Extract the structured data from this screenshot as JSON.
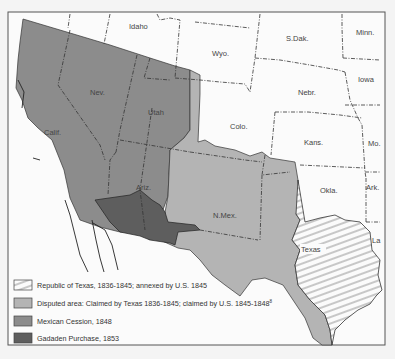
{
  "map": {
    "state_labels": {
      "idaho": "Idaho",
      "wyo": "Wyo.",
      "sdak": "S.Dak.",
      "minn": "Minn.",
      "nev": "Nev.",
      "utah": "Utah",
      "nebr": "Nebr.",
      "iowa": "Iowa",
      "calif": "Calif.",
      "colo": "Colo.",
      "kans": "Kans.",
      "mo": "Mo.",
      "ariz": "Ariz.",
      "nmex": "N.Mex.",
      "okla": "Okla.",
      "ark": "Ark.",
      "texas": "Texas",
      "la": "La"
    },
    "colors": {
      "mexican_cession": "#8c8c8c",
      "disputed_area": "#b4b4b4",
      "gadsden_purchase": "#5e5e5e",
      "republic_of_texas": "hatched",
      "background": "#fbfbfb"
    }
  },
  "legend": {
    "items": [
      {
        "key": "republic_of_texas",
        "label": "Republic of Texas, 1836-1845; annexed by  U.S. 1845"
      },
      {
        "key": "disputed_area",
        "label": "Disputed area: Claimed by Texas 1836-1845; claimed by U.S. 1845-1848",
        "superscript": "8"
      },
      {
        "key": "mexican_cession",
        "label": "Mexican Cession, 1848"
      },
      {
        "key": "gadsden_purchase",
        "label": "Gadaden Purchase, 1853"
      }
    ]
  }
}
